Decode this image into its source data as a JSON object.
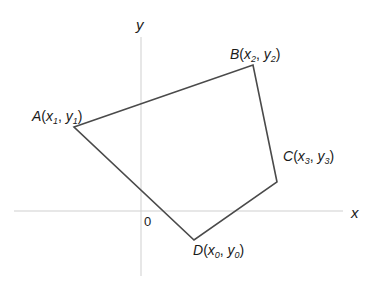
{
  "diagram": {
    "type": "coordinate-quadrilateral",
    "axes": {
      "x_label": "x",
      "y_label": "y",
      "origin_label": "0",
      "axis_color": "#d0d0d0"
    },
    "polygon": {
      "stroke_color": "#4a4a4a",
      "vertices": [
        {
          "name": "A",
          "x_sub": "1",
          "y_sub": "1",
          "px": 74,
          "py": 127
        },
        {
          "name": "B",
          "x_sub": "2",
          "y_sub": "2",
          "px": 253,
          "py": 65
        },
        {
          "name": "C",
          "x_sub": "3",
          "y_sub": "3",
          "px": 277,
          "py": 182
        },
        {
          "name": "D",
          "x_sub": "0",
          "y_sub": "0",
          "px": 194,
          "py": 240
        }
      ]
    },
    "labels": {
      "A": {
        "name": "A",
        "open": "(x",
        "sub1": "1",
        "comma": ", y",
        "sub2": "1",
        "close": ")"
      },
      "B": {
        "name": "B",
        "open": "(x",
        "sub1": "2",
        "comma": ", y",
        "sub2": "2",
        "close": ")"
      },
      "C": {
        "name": "C",
        "open": "(x",
        "sub1": "3",
        "comma": ", y",
        "sub2": "3",
        "close": ")"
      },
      "D": {
        "name": "D",
        "open": "(x",
        "sub1": "0",
        "comma": ", y",
        "sub2": "0",
        "close": ")"
      }
    }
  }
}
